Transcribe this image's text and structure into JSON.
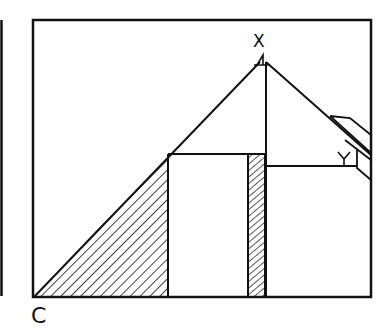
{
  "diagram": {
    "type": "geometry-figure",
    "labels": {
      "x": "X",
      "y": "Y",
      "c": "C"
    },
    "colors": {
      "stroke": "#111111",
      "background": "#ffffff"
    },
    "elements": [
      "outer rectangular frame",
      "left edge line",
      "large triangle from C to apex X",
      "hatched left triangle region",
      "narrow hatched vertical column",
      "right-angle marker at X",
      "angle marker at Y",
      "pencil/ruler tool at right edge"
    ]
  }
}
